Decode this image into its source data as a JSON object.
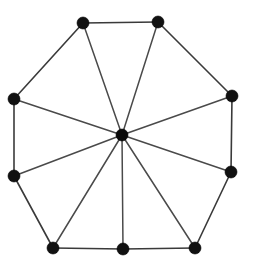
{
  "figure": {
    "description": "Nine-vertex outer polygon cycle with a central hub vertex joined to every outer vertex",
    "canvas": {
      "width": 253,
      "height": 268
    },
    "background_color": "#ffffff",
    "edge_color": "#3a3a3a",
    "spoke_color": "#4a4a4a",
    "vertex_color": "#111111",
    "hub_color": "#0a0a0a",
    "vertex_radius": 6,
    "hub_radius": 6,
    "edge_width": 1.6,
    "spoke_width": 1.5
  },
  "chart_data": {
    "type": "scatter",
    "xlabel": "",
    "ylabel": "",
    "xlim": [
      0,
      253
    ],
    "ylim": [
      0,
      268
    ],
    "grid": false,
    "legend": "none",
    "graph_kind": "wheel",
    "outer_vertex_count": 9,
    "hub_count": 1,
    "total_vertex_count": 10,
    "outer_edge_count": 9,
    "spoke_count": 9,
    "total_edge_count": 18,
    "nodes": [
      {
        "id": "v1",
        "label": "top-left",
        "x": 83,
        "y": 23,
        "role": "outer"
      },
      {
        "id": "v2",
        "label": "top-right",
        "x": 158,
        "y": 22,
        "role": "outer"
      },
      {
        "id": "v3",
        "label": "right-upper",
        "x": 232,
        "y": 96,
        "role": "outer"
      },
      {
        "id": "v4",
        "label": "right-lower",
        "x": 231,
        "y": 172,
        "role": "outer"
      },
      {
        "id": "v5",
        "label": "bottom-right",
        "x": 195,
        "y": 248,
        "role": "outer"
      },
      {
        "id": "v6",
        "label": "bottom-middle",
        "x": 123,
        "y": 249,
        "role": "outer"
      },
      {
        "id": "v7",
        "label": "bottom-left",
        "x": 53,
        "y": 248,
        "role": "outer"
      },
      {
        "id": "v8",
        "label": "left-lower",
        "x": 14,
        "y": 176,
        "role": "outer"
      },
      {
        "id": "v9",
        "label": "left-upper",
        "x": 14,
        "y": 99,
        "role": "outer"
      },
      {
        "id": "hub",
        "label": "center-hub",
        "x": 122,
        "y": 135,
        "role": "hub"
      }
    ],
    "edges": [
      {
        "from": "v1",
        "to": "v2",
        "kind": "rim"
      },
      {
        "from": "v2",
        "to": "v3",
        "kind": "rim"
      },
      {
        "from": "v3",
        "to": "v4",
        "kind": "rim"
      },
      {
        "from": "v4",
        "to": "v5",
        "kind": "rim"
      },
      {
        "from": "v5",
        "to": "v6",
        "kind": "rim"
      },
      {
        "from": "v6",
        "to": "v7",
        "kind": "rim"
      },
      {
        "from": "v7",
        "to": "v8",
        "kind": "rim"
      },
      {
        "from": "v8",
        "to": "v9",
        "kind": "rim"
      },
      {
        "from": "v9",
        "to": "v1",
        "kind": "rim"
      },
      {
        "from": "hub",
        "to": "v1",
        "kind": "spoke"
      },
      {
        "from": "hub",
        "to": "v2",
        "kind": "spoke"
      },
      {
        "from": "hub",
        "to": "v3",
        "kind": "spoke"
      },
      {
        "from": "hub",
        "to": "v4",
        "kind": "spoke"
      },
      {
        "from": "hub",
        "to": "v5",
        "kind": "spoke"
      },
      {
        "from": "hub",
        "to": "v6",
        "kind": "spoke"
      },
      {
        "from": "hub",
        "to": "v7",
        "kind": "spoke"
      },
      {
        "from": "hub",
        "to": "v8",
        "kind": "spoke"
      },
      {
        "from": "hub",
        "to": "v9",
        "kind": "spoke"
      }
    ]
  }
}
